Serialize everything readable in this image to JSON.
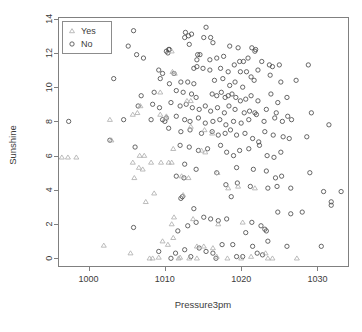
{
  "chart_data": {
    "type": "scatter",
    "title": "",
    "xlabel": "Pressure3pm",
    "ylabel": "Sunshine",
    "xlim": [
      996.0,
      1034.0
    ],
    "ylim": [
      -0.45,
      14.1
    ],
    "xticks": [
      1000,
      1010,
      1020,
      1030
    ],
    "yticks": [
      0,
      2,
      4,
      6,
      8,
      10,
      12,
      14
    ],
    "xticklabels": [
      "1000",
      "1010",
      "1020",
      "1030"
    ],
    "yticklabels": [
      "0",
      "2",
      "4",
      "6",
      "8",
      "10",
      "12",
      "14"
    ],
    "grid": false,
    "legend": {
      "position": "top-left",
      "entries": [
        {
          "label": "Yes",
          "marker": "triangle",
          "color": "#b0b0b0"
        },
        {
          "label": "No",
          "marker": "circle",
          "color": "#4d4d4d"
        }
      ]
    },
    "series": [
      {
        "name": "No",
        "marker": "circle",
        "color": "#4d4d4d",
        "points": [
          [
            1001.6,
            13.5
          ],
          [
            1005.9,
            13.3
          ],
          [
            1012.7,
            13.2
          ],
          [
            1013.5,
            13.1
          ],
          [
            1013.1,
            13.0
          ],
          [
            1015.4,
            13.5
          ],
          [
            1015.1,
            12.9
          ],
          [
            1016.0,
            12.9
          ],
          [
            1016.3,
            12.6
          ],
          [
            1013.2,
            12.5
          ],
          [
            1012.6,
            12.9
          ],
          [
            1018.5,
            12.4
          ],
          [
            1019.6,
            12.3
          ],
          [
            1021.4,
            12.3
          ],
          [
            1021.9,
            12.2
          ],
          [
            1021.8,
            12.1
          ],
          [
            1005.2,
            12.4
          ],
          [
            1006.3,
            11.9
          ],
          [
            1007.2,
            11.7
          ],
          [
            1010.2,
            12.1
          ],
          [
            1010.6,
            12.2
          ],
          [
            1010.4,
            12.0
          ],
          [
            1010.5,
            12.2
          ],
          [
            1014.3,
            11.9
          ],
          [
            1014.6,
            11.9
          ],
          [
            1014.2,
            11.6
          ],
          [
            1015.9,
            11.6
          ],
          [
            1016.8,
            11.7
          ],
          [
            1017.7,
            11.8
          ],
          [
            1019.8,
            11.5
          ],
          [
            1019.1,
            11.3
          ],
          [
            1020.3,
            11.5
          ],
          [
            1020.9,
            11.7
          ],
          [
            1022.7,
            11.5
          ],
          [
            1023.7,
            11.3
          ],
          [
            1024.1,
            11.2
          ],
          [
            1025.0,
            11.3
          ],
          [
            1028.8,
            11.3
          ],
          [
            1009.2,
            11.0
          ],
          [
            1009.7,
            10.8
          ],
          [
            1011.2,
            10.8
          ],
          [
            1013.8,
            11.1
          ],
          [
            1014.2,
            11.2
          ],
          [
            1015.0,
            11.1
          ],
          [
            1015.9,
            11.0
          ],
          [
            1017.3,
            11.1
          ],
          [
            1018.3,
            10.9
          ],
          [
            1019.9,
            10.9
          ],
          [
            1020.7,
            10.9
          ],
          [
            1021.3,
            10.6
          ],
          [
            1022.2,
            11.0
          ],
          [
            1023.8,
            10.7
          ],
          [
            1003.3,
            10.5
          ],
          [
            1009.4,
            10.5
          ],
          [
            1010.6,
            10.2
          ],
          [
            1012.1,
            10.3
          ],
          [
            1013.0,
            10.3
          ],
          [
            1013.8,
            10.2
          ],
          [
            1016.5,
            10.4
          ],
          [
            1017.6,
            10.5
          ],
          [
            1018.5,
            10.1
          ],
          [
            1019.2,
            10.3
          ],
          [
            1020.2,
            10.0
          ],
          [
            1021.7,
            10.4
          ],
          [
            1025.2,
            10.3
          ],
          [
            1027.2,
            10.4
          ],
          [
            1006.9,
            9.5
          ],
          [
            1008.6,
            9.7
          ],
          [
            1011.5,
            9.8
          ],
          [
            1012.4,
            9.7
          ],
          [
            1013.5,
            9.6
          ],
          [
            1014.1,
            9.4
          ],
          [
            1016.2,
            9.6
          ],
          [
            1016.8,
            9.5
          ],
          [
            1017.4,
            9.7
          ],
          [
            1017.9,
            9.4
          ],
          [
            1018.3,
            9.5
          ],
          [
            1018.8,
            9.6
          ],
          [
            1019.3,
            9.4
          ],
          [
            1019.9,
            9.2
          ],
          [
            1020.6,
            9.3
          ],
          [
            1021.3,
            9.5
          ],
          [
            1022.2,
            9.2
          ],
          [
            1023.9,
            9.6
          ],
          [
            1024.8,
            9.1
          ],
          [
            1026.0,
            9.4
          ],
          [
            1006.5,
            8.9
          ],
          [
            1008.4,
            9.0
          ],
          [
            1009.3,
            8.8
          ],
          [
            1010.8,
            9.1
          ],
          [
            1012.0,
            8.9
          ],
          [
            1012.8,
            9.0
          ],
          [
            1013.6,
            8.8
          ],
          [
            1014.5,
            8.7
          ],
          [
            1015.3,
            8.9
          ],
          [
            1016.0,
            8.6
          ],
          [
            1016.9,
            8.8
          ],
          [
            1017.8,
            8.5
          ],
          [
            1018.4,
            8.9
          ],
          [
            1019.2,
            8.7
          ],
          [
            1020.4,
            8.5
          ],
          [
            1021.1,
            8.6
          ],
          [
            1021.8,
            8.5
          ],
          [
            1022.0,
            8.4
          ],
          [
            1023.3,
            8.7
          ],
          [
            1024.6,
            8.5
          ],
          [
            1026.1,
            8.3
          ],
          [
            1029.2,
            8.5
          ],
          [
            1004.6,
            8.1
          ],
          [
            1008.2,
            8.1
          ],
          [
            1009.7,
            8.1
          ],
          [
            1010.0,
            8.0
          ],
          [
            1010.2,
            8.2
          ],
          [
            1011.5,
            8.3
          ],
          [
            1012.6,
            8.1
          ],
          [
            1013.3,
            8.0
          ],
          [
            1014.4,
            8.2
          ],
          [
            1015.3,
            7.9
          ],
          [
            1016.3,
            8.0
          ],
          [
            1017.2,
            8.1
          ],
          [
            1018.0,
            7.8
          ],
          [
            1019.0,
            8.0
          ],
          [
            1020.0,
            7.9
          ],
          [
            1021.0,
            8.1
          ],
          [
            1023.0,
            8.0
          ],
          [
            1024.4,
            8.2
          ],
          [
            1025.4,
            8.0
          ],
          [
            1026.6,
            8.1
          ],
          [
            997.4,
            8.0
          ],
          [
            1031.5,
            7.8
          ],
          [
            1010.5,
            7.6
          ],
          [
            1012.1,
            7.4
          ],
          [
            1013.3,
            7.5
          ],
          [
            1014.8,
            7.3
          ],
          [
            1016.2,
            7.4
          ],
          [
            1017.0,
            7.2
          ],
          [
            1017.9,
            7.3
          ],
          [
            1018.6,
            7.5
          ],
          [
            1019.4,
            7.2
          ],
          [
            1020.5,
            7.3
          ],
          [
            1021.5,
            7.0
          ],
          [
            1022.3,
            6.8
          ],
          [
            1023.1,
            7.4
          ],
          [
            1024.2,
            7.2
          ],
          [
            1025.5,
            7.1
          ],
          [
            1026.3,
            7.0
          ],
          [
            1028.6,
            7.1
          ],
          [
            1002.8,
            6.9
          ],
          [
            1012.0,
            6.6
          ],
          [
            1013.2,
            6.5
          ],
          [
            1014.4,
            6.3
          ],
          [
            1015.6,
            6.4
          ],
          [
            1017.3,
            6.6
          ],
          [
            1018.1,
            6.2
          ],
          [
            1019.0,
            6.0
          ],
          [
            1019.8,
            6.3
          ],
          [
            1021.0,
            6.4
          ],
          [
            1022.4,
            6.6
          ],
          [
            1023.4,
            6.0
          ],
          [
            1024.3,
            5.9
          ],
          [
            1025.2,
            6.2
          ],
          [
            1006.1,
            6.5
          ],
          [
            1012.6,
            5.5
          ],
          [
            1014.1,
            5.2
          ],
          [
            1016.8,
            5.0
          ],
          [
            1019.4,
            5.3
          ],
          [
            1021.6,
            5.2
          ],
          [
            1023.3,
            5.1
          ],
          [
            1024.5,
            4.7
          ],
          [
            1025.3,
            4.8
          ],
          [
            1029.0,
            5.0
          ],
          [
            1011.5,
            4.8
          ],
          [
            1012.5,
            4.7
          ],
          [
            1018.0,
            4.3
          ],
          [
            1019.5,
            4.4
          ],
          [
            1021.2,
            4.2
          ],
          [
            1023.5,
            4.1
          ],
          [
            1024.7,
            4.2
          ],
          [
            1026.5,
            4.1
          ],
          [
            1030.8,
            3.9
          ],
          [
            1033.1,
            3.9
          ],
          [
            1012.3,
            3.6
          ],
          [
            1018.7,
            3.6
          ],
          [
            1031.8,
            3.1
          ],
          [
            1031.8,
            3.3
          ],
          [
            1012.1,
            3.5
          ],
          [
            1013.8,
            2.9
          ],
          [
            1015.1,
            2.4
          ],
          [
            1016.0,
            2.3
          ],
          [
            1017.0,
            2.2
          ],
          [
            1018.1,
            2.3
          ],
          [
            1021.4,
            2.1
          ],
          [
            1022.6,
            1.9
          ],
          [
            1023.1,
            1.7
          ],
          [
            1023.3,
            1.6
          ],
          [
            1024.8,
            2.7
          ],
          [
            1026.5,
            2.6
          ],
          [
            1028.0,
            2.7
          ],
          [
            1005.9,
            1.8
          ],
          [
            1011.7,
            1.6
          ],
          [
            1013.0,
            1.9
          ],
          [
            1014.1,
            2.1
          ],
          [
            1018.9,
            0.8
          ],
          [
            1020.6,
            1.5
          ],
          [
            1023.5,
            1.0
          ],
          [
            1009.2,
            0.4
          ],
          [
            1011.4,
            0.3
          ],
          [
            1012.6,
            0.5
          ],
          [
            1014.5,
            0.6
          ],
          [
            1015.4,
            0.4
          ],
          [
            1016.3,
            0.3
          ],
          [
            1017.5,
            0.8
          ],
          [
            1019.4,
            0.1
          ],
          [
            1021.5,
            0.7
          ],
          [
            1022.8,
            0.2
          ],
          [
            1026.0,
            0.7
          ],
          [
            1030.5,
            0.7
          ],
          [
            1010.8,
            0.0
          ],
          [
            1013.4,
            0.1
          ],
          [
            1016.7,
            0.0
          ],
          [
            1020.2,
            0.1
          ],
          [
            1022.1,
            0.3
          ]
        ]
      },
      {
        "name": "Yes",
        "marker": "triangle",
        "color": "#b0b0b0",
        "points": [
          [
            1011.0,
            10.9
          ],
          [
            1011.3,
            10.8
          ],
          [
            1010.9,
            12.1
          ],
          [
            1009.4,
            9.7
          ],
          [
            1012.9,
            9.2
          ],
          [
            1013.4,
            9.2
          ],
          [
            1006.8,
            8.9
          ],
          [
            1005.8,
            8.4
          ],
          [
            1006.4,
            8.5
          ],
          [
            1009.4,
            8.4
          ],
          [
            1010.2,
            8.3
          ],
          [
            1002.8,
            8.1
          ],
          [
            1010.1,
            8.2
          ],
          [
            1013.4,
            7.7
          ],
          [
            1015.2,
            7.5
          ],
          [
            1016.2,
            7.3
          ],
          [
            1003.0,
            6.9
          ],
          [
            996.5,
            5.9
          ],
          [
            997.3,
            5.9
          ],
          [
            998.4,
            5.9
          ],
          [
            1006.7,
            6.0
          ],
          [
            1007.3,
            6.0
          ],
          [
            1008.2,
            5.6
          ],
          [
            1009.5,
            5.6
          ],
          [
            1010.5,
            5.6
          ],
          [
            1010.9,
            5.6
          ],
          [
            1011.1,
            6.4
          ],
          [
            1014.8,
            6.3
          ],
          [
            1015.3,
            6.2
          ],
          [
            1005.8,
            5.6
          ],
          [
            1006.6,
            5.3
          ],
          [
            1007.1,
            5.2
          ],
          [
            1006.0,
            4.7
          ],
          [
            1012.2,
            4.8
          ],
          [
            1013.1,
            4.7
          ],
          [
            1016.9,
            5.0
          ],
          [
            1018.3,
            4.1
          ],
          [
            1019.6,
            4.2
          ],
          [
            1021.8,
            4.1
          ],
          [
            1008.6,
            3.8
          ],
          [
            1012.4,
            3.7
          ],
          [
            1007.5,
            3.3
          ],
          [
            1011.2,
            2.4
          ],
          [
            1013.7,
            2.3
          ],
          [
            1010.9,
            2.0
          ],
          [
            1017.0,
            2.0
          ],
          [
            1020.2,
            2.1
          ],
          [
            1011.1,
            1.2
          ],
          [
            1009.7,
            1.0
          ],
          [
            1010.4,
            0.8
          ],
          [
            1014.2,
            0.7
          ],
          [
            1015.1,
            0.7
          ],
          [
            1016.3,
            0.6
          ],
          [
            1002.0,
            0.75
          ],
          [
            1005.5,
            0.3
          ],
          [
            1008.0,
            0.0
          ],
          [
            1008.4,
            0.0
          ],
          [
            1011.8,
            0.0
          ],
          [
            1013.2,
            0.0
          ],
          [
            1014.2,
            0.0
          ],
          [
            1018.2,
            0.0
          ],
          [
            1020.0,
            0.0
          ],
          [
            1021.3,
            0.1
          ],
          [
            1023.5,
            0.0
          ],
          [
            1024.1,
            0.0
          ],
          [
            1027.3,
            0.0
          ],
          [
            1009.2,
            0.05
          ],
          [
            1012.0,
            0.05
          ],
          [
            1016.8,
            0.1
          ],
          [
            1023.2,
            0.3
          ]
        ]
      }
    ]
  },
  "plot_geometry": {
    "box_left": 58,
    "box_top": 17,
    "box_right": 348,
    "box_bottom": 266
  },
  "legend_geometry": {
    "x": 62,
    "y": 21,
    "width": 49,
    "height": 32
  }
}
